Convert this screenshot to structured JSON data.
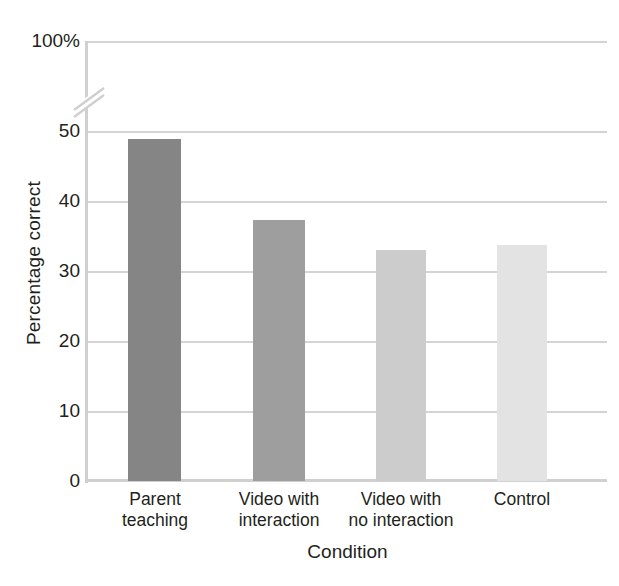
{
  "chart_data": {
    "type": "bar",
    "title": "",
    "xlabel": "Condition",
    "ylabel": "Percentage correct",
    "categories": [
      "Parent teaching",
      "Video with interaction",
      "Video with no interaction",
      "Control"
    ],
    "category_lines": [
      [
        "Parent",
        "teaching"
      ],
      [
        "Video with",
        "interaction"
      ],
      [
        "Video with",
        "no interaction"
      ],
      [
        "Control",
        ""
      ]
    ],
    "values": [
      49,
      37.4,
      33.1,
      33.8
    ],
    "bar_colors": [
      "#858585",
      "#9e9e9e",
      "#cccccc",
      "#e3e3e3"
    ],
    "ylim": [
      0,
      50
    ],
    "y_ticks": [
      0,
      10,
      20,
      30,
      40,
      50
    ],
    "y_tick_labels": [
      "0",
      "10",
      "20",
      "30",
      "40",
      "50"
    ],
    "y_top_label": "100%",
    "axis_break": true,
    "axis_break_between": [
      50,
      100
    ],
    "grid": true,
    "grid_color": "#d4d4d4",
    "axis_color": "#d0d0d0",
    "legend": "none",
    "text_color": "#231f20"
  },
  "axis": {
    "y_title": "Percentage correct",
    "x_title": "Condition",
    "y_tick_100": "100%",
    "y_tick_50": "50",
    "y_tick_40": "40",
    "y_tick_30": "30",
    "y_tick_20": "20",
    "y_tick_10": "10",
    "y_tick_0": "0"
  },
  "xticks": [
    {
      "line1": "Parent",
      "line2": "teaching"
    },
    {
      "line1": "Video with",
      "line2": "interaction"
    },
    {
      "line1": "Video with",
      "line2": "no interaction"
    },
    {
      "line1": "Control",
      "line2": ""
    }
  ],
  "clipped_header": ""
}
